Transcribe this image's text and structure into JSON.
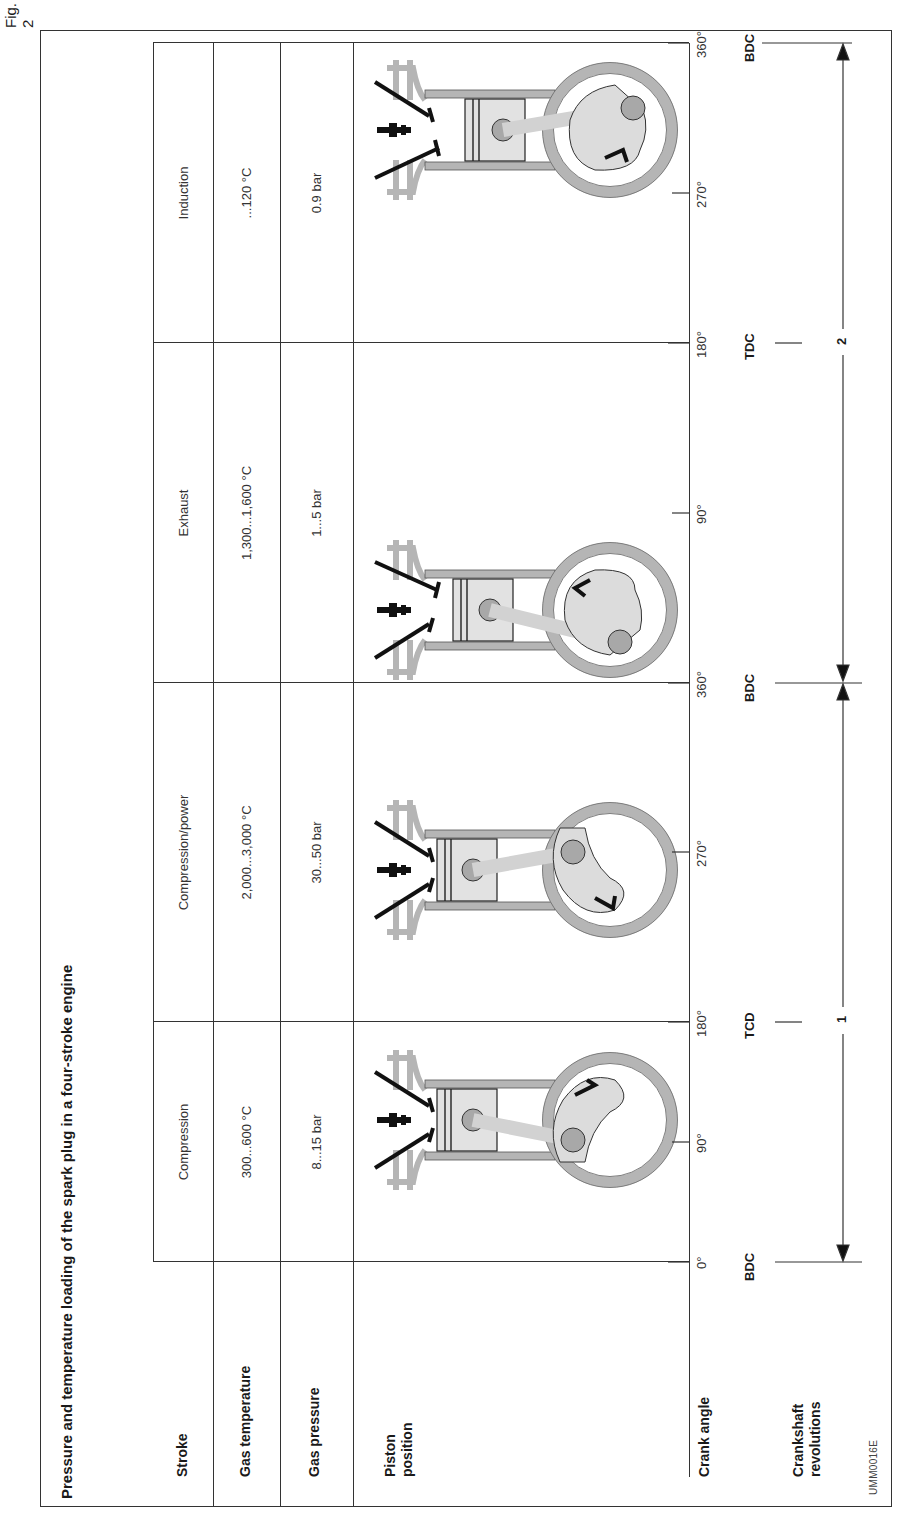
{
  "figure": {
    "label": "Fig. 2",
    "title": "Pressure and temperature loading of the spark plug in a four-stroke engine",
    "code": "UMM0016E"
  },
  "row_headers": {
    "stroke": "Stroke",
    "gas_temperature": "Gas temperature",
    "gas_pressure": "Gas pressure",
    "piston_position_line1": "Piston",
    "piston_position_line2": "position",
    "crank_angle": "Crank angle",
    "crankshaft_revolutions_line1": "Crankshaft",
    "crankshaft_revolutions_line2": "revolutions"
  },
  "strokes": [
    {
      "name": "Compression",
      "gas_temperature": "300...600 °C",
      "gas_pressure": "8...15 bar",
      "crank_arrow": "clockwise-down"
    },
    {
      "name": "Compression/power",
      "gas_temperature": "2,000...3,000 °C",
      "gas_pressure": "30...50 bar",
      "crank_arrow": "down"
    },
    {
      "name": "Exhaust",
      "gas_temperature": "1,300...1,600 °C",
      "gas_pressure": "1...5 bar",
      "crank_arrow": "up"
    },
    {
      "name": "Induction",
      "gas_temperature": "...120 °C",
      "gas_pressure": "0.9 bar",
      "crank_arrow": "down-left"
    }
  ],
  "crank_angle_ticks": [
    "0°",
    "90°",
    "180°",
    "270°",
    "360°",
    "90°",
    "180°",
    "270°",
    "360°"
  ],
  "dead_centers": [
    {
      "label": "BDC",
      "angle": "0°"
    },
    {
      "label": "TCD",
      "angle": "180°"
    },
    {
      "label": "BDC",
      "angle": "360°"
    },
    {
      "label": "TDC",
      "angle": "180°"
    },
    {
      "label": "BDC",
      "angle": "360°"
    }
  ],
  "revolutions": [
    "1",
    "2"
  ],
  "colors": {
    "line": "#333333",
    "engine_wall": "#b5b5b5",
    "piston_fill": "#e2e2e2",
    "crank_fill": "#dcdcdc",
    "pin_fill": "#a8a8a8",
    "valve": "#111111"
  }
}
